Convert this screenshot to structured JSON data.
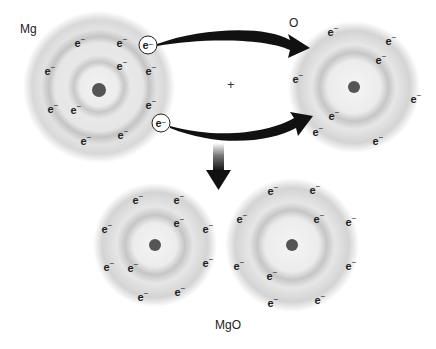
{
  "diagram": {
    "labels": {
      "mg": "Mg",
      "o": "O",
      "product": "MgO",
      "plus": "+"
    },
    "electron_symbol": "e",
    "electron_charge": "−",
    "atoms": [
      {
        "name": "Mg",
        "cx": 99,
        "cy": 87,
        "shells": [
          22,
          45,
          72
        ],
        "electrons": 12,
        "transferred": 2
      },
      {
        "name": "O",
        "cx": 354,
        "cy": 87,
        "shells": [
          28,
          63
        ],
        "electrons": 8
      },
      {
        "name": "Mg2+",
        "cx": 155,
        "cy": 245,
        "shells": [
          22,
          55
        ],
        "electrons": 10
      },
      {
        "name": "O2-",
        "cx": 292,
        "cy": 245,
        "shells": [
          28,
          63
        ],
        "electrons": 10
      }
    ],
    "colors": {
      "shell": "#bdbdbd",
      "nucleus": "#555555",
      "arrow": "#111111",
      "text": "#222222"
    }
  }
}
